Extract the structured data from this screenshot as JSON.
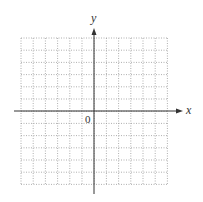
{
  "diagram": {
    "type": "coordinate-plane",
    "x_axis_label": "x",
    "y_axis_label": "y",
    "origin_label": "0",
    "grid": {
      "columns": 12,
      "rows": 12,
      "left": 21,
      "top": 38,
      "cell": 12.2,
      "style": "dotted",
      "color": "#9a9a9a"
    },
    "axes": {
      "origin_x": 94,
      "origin_y": 111,
      "x_start": 14,
      "x_end": 183,
      "y_start": 194,
      "y_end": 28,
      "color": "#333333"
    }
  }
}
